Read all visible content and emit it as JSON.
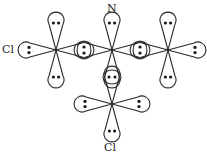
{
  "diagram": {
    "type": "orbital-overlap",
    "labels": {
      "top": "N",
      "left": "Cl",
      "bottom": "Cl"
    },
    "colors": {
      "stroke": "#2a2a2a",
      "electron": "#1a1a1a",
      "background": "#ffffff"
    },
    "atoms": [
      {
        "id": "left",
        "cx": 56,
        "cy": 50
      },
      {
        "id": "center",
        "cx": 112,
        "cy": 50
      },
      {
        "id": "right",
        "cx": 168,
        "cy": 50
      },
      {
        "id": "bottom",
        "cx": 112,
        "cy": 104
      }
    ]
  }
}
